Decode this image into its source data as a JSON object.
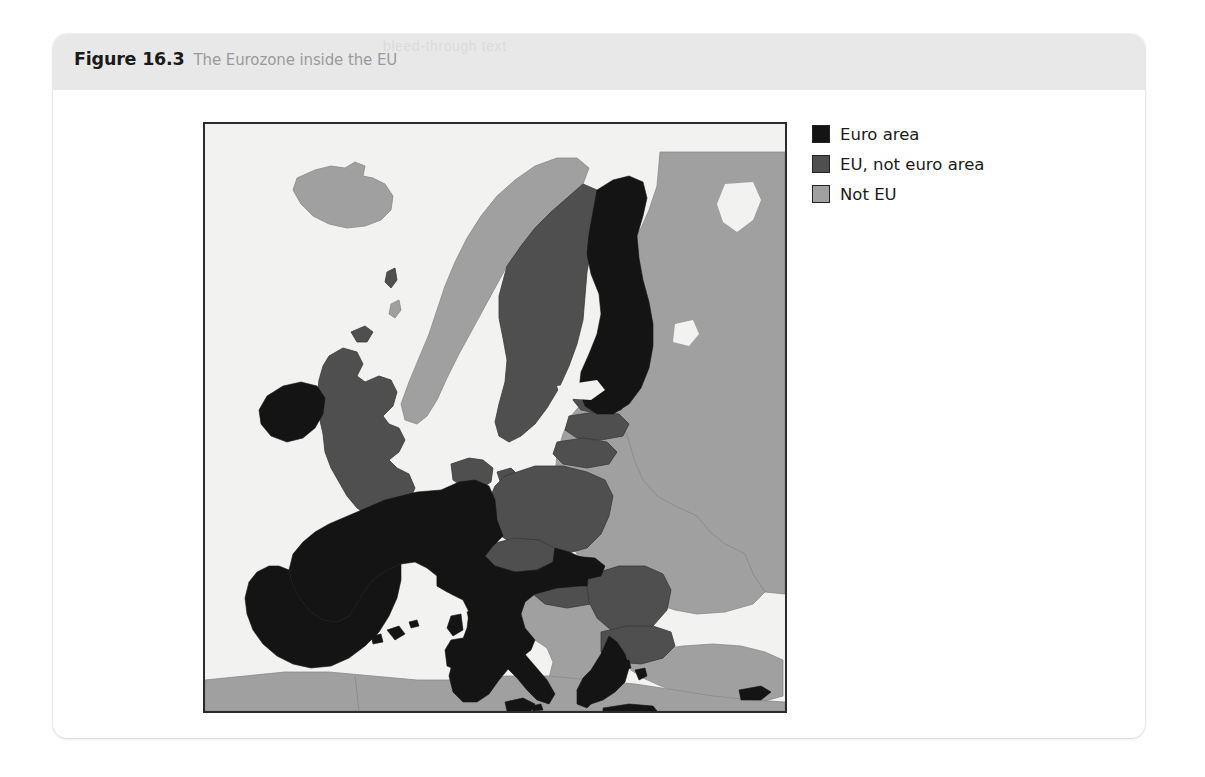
{
  "figure": {
    "number": "Figure 16.3",
    "caption": "The Eurozone inside the EU",
    "ghost_text": "bleed-through text"
  },
  "legend": {
    "items": [
      {
        "label": "Euro area",
        "color": "#141414",
        "key": "euro"
      },
      {
        "label": "EU, not euro area",
        "color": "#4f4f4f",
        "key": "eu_not_euro"
      },
      {
        "label": "Not EU",
        "color": "#a0a0a0",
        "key": "not_eu"
      }
    ]
  },
  "map": {
    "title": "The Eurozone inside the EU",
    "sea_color": "#f2f2f0",
    "border_color": "#2b2b2b",
    "category_colors": {
      "euro": "#141414",
      "eu_not_euro": "#4f4f4f",
      "not_eu": "#a0a0a0"
    },
    "regions": [
      {
        "name": "Ireland",
        "category": "euro"
      },
      {
        "name": "France",
        "category": "euro"
      },
      {
        "name": "Spain",
        "category": "euro"
      },
      {
        "name": "Portugal",
        "category": "euro"
      },
      {
        "name": "Germany",
        "category": "euro"
      },
      {
        "name": "Belgium",
        "category": "euro"
      },
      {
        "name": "Netherlands",
        "category": "euro"
      },
      {
        "name": "Luxembourg",
        "category": "euro"
      },
      {
        "name": "Austria",
        "category": "euro"
      },
      {
        "name": "Italy",
        "category": "euro"
      },
      {
        "name": "Slovenia",
        "category": "euro"
      },
      {
        "name": "Slovakia",
        "category": "euro"
      },
      {
        "name": "Finland",
        "category": "euro"
      },
      {
        "name": "Greece",
        "category": "euro"
      },
      {
        "name": "Malta",
        "category": "euro"
      },
      {
        "name": "Cyprus",
        "category": "euro"
      },
      {
        "name": "United Kingdom",
        "category": "eu_not_euro"
      },
      {
        "name": "Sweden",
        "category": "eu_not_euro"
      },
      {
        "name": "Denmark",
        "category": "eu_not_euro"
      },
      {
        "name": "Poland",
        "category": "eu_not_euro"
      },
      {
        "name": "Czech Republic",
        "category": "eu_not_euro"
      },
      {
        "name": "Hungary",
        "category": "eu_not_euro"
      },
      {
        "name": "Romania",
        "category": "eu_not_euro"
      },
      {
        "name": "Bulgaria",
        "category": "eu_not_euro"
      },
      {
        "name": "Estonia",
        "category": "eu_not_euro"
      },
      {
        "name": "Latvia",
        "category": "eu_not_euro"
      },
      {
        "name": "Lithuania",
        "category": "eu_not_euro"
      },
      {
        "name": "Norway",
        "category": "not_eu"
      },
      {
        "name": "Iceland",
        "category": "not_eu"
      },
      {
        "name": "Switzerland",
        "category": "not_eu"
      },
      {
        "name": "Russia",
        "category": "not_eu"
      },
      {
        "name": "Belarus",
        "category": "not_eu"
      },
      {
        "name": "Ukraine",
        "category": "not_eu"
      },
      {
        "name": "Moldova",
        "category": "not_eu"
      },
      {
        "name": "Turkey",
        "category": "not_eu"
      },
      {
        "name": "Serbia",
        "category": "not_eu"
      },
      {
        "name": "Croatia",
        "category": "not_eu"
      },
      {
        "name": "Bosnia",
        "category": "not_eu"
      },
      {
        "name": "Albania",
        "category": "not_eu"
      },
      {
        "name": "North Africa",
        "category": "not_eu"
      }
    ]
  }
}
